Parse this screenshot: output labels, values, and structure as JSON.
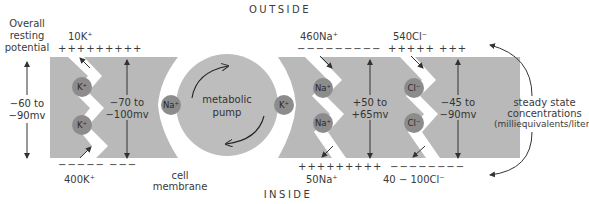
{
  "labels": {
    "outside": "OUTSIDE",
    "inside": "INSIDE",
    "overall_line1": "Overall",
    "overall_line2": "resting",
    "overall_line3": "potential",
    "overall_value_line1": "−60 to",
    "overall_value_line2": "−90mv",
    "cell_membrane_line1": "cell",
    "cell_membrane_line2": "membrane",
    "pump_line1": "metabolic",
    "pump_line2": "pump",
    "steady_line1": "steady state",
    "steady_line2": "concentrations",
    "steady_line3": "(milliequivalents/liter)"
  },
  "ions": {
    "k": {
      "outside_conc": "10K⁺",
      "inside_conc": "400K⁺",
      "outside_charge": "+++++++++",
      "inside_charge": "−−−−− −−−",
      "potential_line1": "−70 to",
      "potential_line2": "−100mv",
      "symbol": "K⁺"
    },
    "na": {
      "outside_conc": "460Na⁺",
      "inside_conc": "50Na⁺",
      "outside_charge": "−−−−−−−−−",
      "inside_charge": "+++++++++",
      "potential_line1": "+50 to",
      "potential_line2": "+65mv",
      "symbol": "Na⁺"
    },
    "cl": {
      "outside_conc": "540Cl⁻",
      "inside_conc": "40 − 100Cl⁻",
      "outside_charge": "+++++ +++",
      "inside_charge": "−−−−−−−−",
      "potential_line1": "−45 to",
      "potential_line2": "−90mv",
      "symbol": "Cl⁻"
    }
  },
  "colors": {
    "membrane_gray": "#b9b9b9",
    "ion_circle": "#8c8c8c",
    "pump_gray": "#bdbdbd",
    "text": "#3a3a3a"
  }
}
